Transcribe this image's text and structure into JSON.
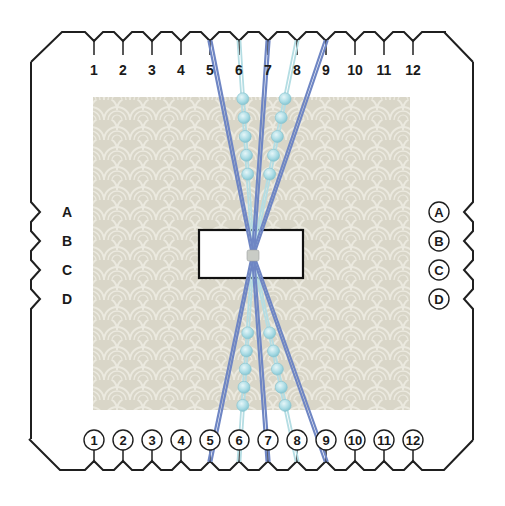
{
  "diagram": {
    "colors": {
      "outline": "#1f1f1f",
      "fabric": "#d9d6c8",
      "fabric_pattern": "#ebe9df",
      "thread_dark": "#6f86c4",
      "thread_light": "#b4dde3",
      "bead": "#a9dbe4",
      "knot": "#c9ccc6"
    },
    "top_slots": [
      "1",
      "2",
      "3",
      "4",
      "5",
      "6",
      "7",
      "8",
      "9",
      "10",
      "11",
      "12"
    ],
    "bottom_slots": [
      "1",
      "2",
      "3",
      "4",
      "5",
      "6",
      "7",
      "8",
      "9",
      "10",
      "11",
      "12"
    ],
    "left_slots": [
      "A",
      "B",
      "C",
      "D"
    ],
    "right_slots": [
      "A",
      "B",
      "C",
      "D"
    ],
    "threads": {
      "dark_top_slots": [
        "5",
        "7",
        "9"
      ],
      "light_top_slots": [
        "6",
        "8"
      ],
      "dark_bottom_slots": [
        "5",
        "7",
        "9"
      ],
      "light_bottom_slots": [
        "6",
        "8"
      ],
      "beads_per_strand": 5
    }
  }
}
